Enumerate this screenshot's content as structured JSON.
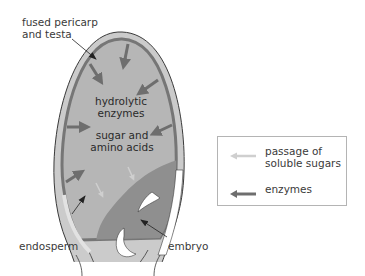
{
  "labels": {
    "pericarp_line1": "fused pericarp",
    "pericarp_line2": "and testa",
    "hydrolytic_line1": "hydrolytic",
    "hydrolytic_line2": "enzymes",
    "sugar_line1": "sugar and",
    "sugar_line2": "amino acids",
    "endosperm": "endosperm",
    "embryo": "embryo"
  },
  "legend": {
    "items": [
      {
        "label_line1": "passage of",
        "label_line2": "soluble sugars",
        "arrow": "light-arrow-icon",
        "color": "#c8c8c8"
      },
      {
        "label_line1": "enzymes",
        "label_line2": "",
        "arrow": "dark-arrow-icon",
        "color": "#6e6e6e"
      }
    ]
  },
  "colors": {
    "seed_coat": "#c9c9c9",
    "outline": "#3a3a3a",
    "aleurone": "#7a7a7a",
    "endosperm": "#b5b5b5",
    "embryo": "#8e8e8e",
    "enzyme_arrow": "#6e6e6e",
    "sugar_arrow": "#cfcfcf"
  }
}
